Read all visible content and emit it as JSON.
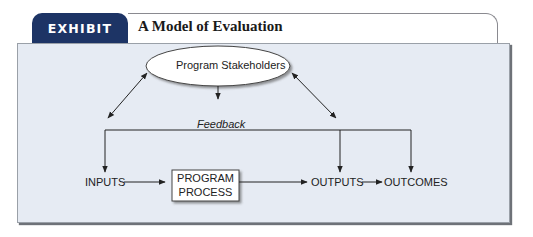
{
  "exhibit": {
    "tab_label": "EXHIBIT 10.1",
    "title": "A Model of Evaluation",
    "colors": {
      "tab_bg": "#1d3465",
      "panel_bg": "#e6ebf3"
    }
  },
  "diagram": {
    "stakeholders": "Program Stakeholders",
    "feedback": "Feedback",
    "inputs": "INPUTS",
    "process_line1": "PROGRAM",
    "process_line2": "PROCESS",
    "outputs": "OUTPUTS",
    "outcomes": "OUTCOMES"
  }
}
